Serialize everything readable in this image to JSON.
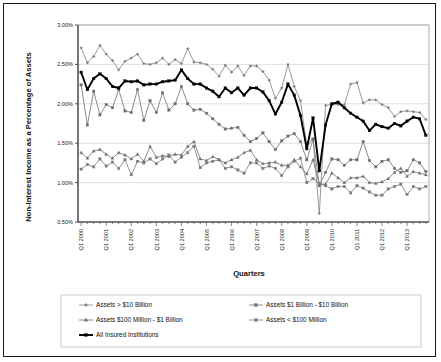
{
  "chart_data": {
    "type": "line",
    "title": "",
    "xlabel": "Quarters",
    "ylabel": "Non-Interest Income as a Percentage of Assets",
    "ylim": [
      0.5,
      3.0
    ],
    "ytick_labels": [
      "0.50%",
      "1.00%",
      "1.50%",
      "2.00%",
      "2.50%",
      "3.00%"
    ],
    "ytick_values": [
      0.5,
      1.0,
      1.5,
      2.0,
      2.5,
      3.0
    ],
    "grid": true,
    "legend_position": "bottom",
    "x_axis_tick_labels": [
      "Q1 2000",
      "Q1 2001",
      "Q1 2002",
      "Q1 2003",
      "Q1 2004",
      "Q1 2005",
      "Q1 2006",
      "Q1 2007",
      "Q1 2008",
      "Q1 2009",
      "Q1 2010",
      "Q1 2011",
      "Q1 2012",
      "Q1 2013"
    ],
    "x_labeled_indices": [
      0,
      4,
      8,
      12,
      16,
      20,
      24,
      28,
      32,
      36,
      40,
      44,
      48,
      52
    ],
    "x": [
      "Q1 2000",
      "Q2 2000",
      "Q3 2000",
      "Q4 2000",
      "Q1 2001",
      "Q2 2001",
      "Q3 2001",
      "Q4 2001",
      "Q1 2002",
      "Q2 2002",
      "Q3 2002",
      "Q4 2002",
      "Q1 2003",
      "Q2 2003",
      "Q3 2003",
      "Q4 2003",
      "Q1 2004",
      "Q2 2004",
      "Q3 2004",
      "Q4 2004",
      "Q1 2005",
      "Q2 2005",
      "Q3 2005",
      "Q4 2005",
      "Q1 2006",
      "Q2 2006",
      "Q3 2006",
      "Q4 2006",
      "Q1 2007",
      "Q2 2007",
      "Q3 2007",
      "Q4 2007",
      "Q1 2008",
      "Q2 2008",
      "Q3 2008",
      "Q4 2008",
      "Q1 2009",
      "Q2 2009",
      "Q3 2009",
      "Q4 2009",
      "Q1 2010",
      "Q2 2010",
      "Q3 2010",
      "Q4 2010",
      "Q1 2011",
      "Q2 2011",
      "Q3 2011",
      "Q4 2011",
      "Q1 2012",
      "Q2 2012",
      "Q3 2012",
      "Q4 2012",
      "Q1 2013",
      "Q2 2013",
      "Q3 2013",
      "Q4 2013"
    ],
    "series": [
      {
        "name": "Assets > $10 Billion",
        "marker": "diamond",
        "color": "#808080",
        "line_width": 0.8,
        "values": [
          2.71,
          2.52,
          2.6,
          2.74,
          2.63,
          2.55,
          2.43,
          2.54,
          2.58,
          2.63,
          2.51,
          2.5,
          2.52,
          2.58,
          2.5,
          2.56,
          2.51,
          2.7,
          2.53,
          2.52,
          2.5,
          2.44,
          2.35,
          2.49,
          2.4,
          2.48,
          2.36,
          2.48,
          2.48,
          2.41,
          2.3,
          2.07,
          2.2,
          2.5,
          2.22,
          2.04,
          1.46,
          1.56,
          0.61,
          1.98,
          1.99,
          1.99,
          1.99,
          2.25,
          2.27,
          2.01,
          2.05,
          2.05,
          1.99,
          1.95,
          1.84,
          1.9,
          1.91,
          1.9,
          1.89,
          1.8
        ]
      },
      {
        "name": "Assets $1 Billion - $10 Billion",
        "marker": "square",
        "color": "#6e6e6e",
        "line_width": 0.8,
        "values": [
          2.24,
          1.73,
          2.16,
          1.86,
          1.99,
          1.95,
          2.18,
          1.91,
          1.89,
          2.18,
          1.79,
          2.04,
          1.89,
          2.14,
          1.92,
          2.0,
          2.22,
          2.0,
          1.92,
          1.93,
          1.88,
          1.81,
          1.74,
          1.68,
          1.69,
          1.7,
          1.6,
          1.52,
          1.56,
          1.63,
          1.52,
          1.42,
          1.53,
          1.59,
          1.62,
          1.52,
          1.29,
          1.55,
          0.96,
          1.13,
          1.3,
          1.29,
          1.22,
          1.29,
          1.29,
          1.52,
          1.28,
          1.2,
          1.27,
          1.29,
          1.18,
          1.13,
          1.15,
          1.29,
          1.25,
          1.14
        ]
      },
      {
        "name": "Assets $100 Million - $1 Billion",
        "marker": "triangle",
        "color": "#6e6e6e",
        "line_width": 0.8,
        "values": [
          1.38,
          1.31,
          1.4,
          1.42,
          1.36,
          1.31,
          1.38,
          1.35,
          1.3,
          1.36,
          1.27,
          1.46,
          1.32,
          1.34,
          1.33,
          1.36,
          1.35,
          1.46,
          1.52,
          1.3,
          1.28,
          1.33,
          1.29,
          1.25,
          1.29,
          1.32,
          1.38,
          1.41,
          1.29,
          1.24,
          1.25,
          1.26,
          1.22,
          1.22,
          1.29,
          1.2,
          1.11,
          1.29,
          0.98,
          0.98,
          1.12,
          1.06,
          1.0,
          1.06,
          1.06,
          1.08,
          1.0,
          0.99,
          1.01,
          1.05,
          1.13,
          1.18,
          1.08,
          1.14,
          1.12,
          1.1
        ]
      },
      {
        "name": "Assets < $100 Million",
        "marker": "square",
        "color": "#7a7a7a",
        "line_width": 0.8,
        "values": [
          1.17,
          1.23,
          1.2,
          1.3,
          1.21,
          1.26,
          1.18,
          1.29,
          1.1,
          1.27,
          1.25,
          1.3,
          1.24,
          1.3,
          1.35,
          1.26,
          1.32,
          1.38,
          1.46,
          1.19,
          1.25,
          1.27,
          1.29,
          1.18,
          1.2,
          1.16,
          1.12,
          1.25,
          1.25,
          1.18,
          1.21,
          1.18,
          1.09,
          1.2,
          1.27,
          1.31,
          1.0,
          1.05,
          0.99,
          0.96,
          0.92,
          0.95,
          0.95,
          0.87,
          0.96,
          0.93,
          0.88,
          0.84,
          0.84,
          0.92,
          0.95,
          0.98,
          0.85,
          0.95,
          0.92,
          0.95
        ]
      },
      {
        "name": "All Insured Institutions",
        "marker": "square",
        "color": "#000000",
        "line_width": 1.9,
        "values": [
          2.4,
          2.18,
          2.32,
          2.38,
          2.32,
          2.22,
          2.2,
          2.29,
          2.28,
          2.29,
          2.24,
          2.25,
          2.25,
          2.28,
          2.29,
          2.3,
          2.43,
          2.32,
          2.25,
          2.25,
          2.2,
          2.16,
          2.09,
          2.2,
          2.14,
          2.2,
          2.11,
          2.2,
          2.2,
          2.15,
          2.04,
          1.87,
          2.02,
          2.25,
          2.11,
          1.85,
          1.43,
          1.82,
          1.15,
          1.73,
          2.0,
          2.02,
          1.95,
          1.88,
          1.83,
          1.78,
          1.66,
          1.74,
          1.71,
          1.69,
          1.75,
          1.72,
          1.78,
          1.83,
          1.81,
          1.6
        ]
      }
    ]
  },
  "axis": {
    "ylabel": "Non-Interest Income as a Percentage of Assets",
    "xlabel": "Quarters"
  },
  "legend": {
    "items": [
      {
        "label": "Assets > $10 Billion",
        "marker": "diamond-marker",
        "color": "#808080"
      },
      {
        "label": "Assets $1 Billion - $10 Billion",
        "marker": "square-marker",
        "color": "#6e6e6e"
      },
      {
        "label": "Assets $100 Million - $1 Billion",
        "marker": "triangle-marker",
        "color": "#6e6e6e"
      },
      {
        "label": "Assets < $100 Million",
        "marker": "square-marker",
        "color": "#7a7a7a"
      },
      {
        "label": "All Insured Institutions",
        "marker": "square-marker",
        "color": "#000000"
      }
    ]
  }
}
